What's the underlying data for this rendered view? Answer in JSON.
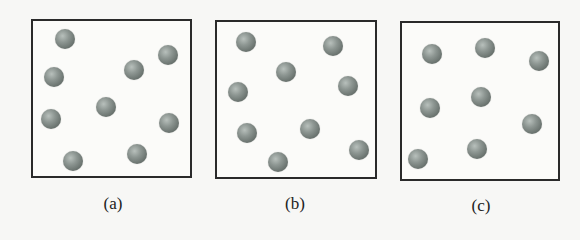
{
  "panels": [
    {
      "id": "a",
      "label": "(a)",
      "box": {
        "x": 31,
        "y": 19,
        "w": 161,
        "h": 159
      },
      "label_pos": {
        "x": 113,
        "y": 194
      },
      "particles": [
        [
          65,
          39
        ],
        [
          168,
          55
        ],
        [
          134,
          70
        ],
        [
          54,
          77
        ],
        [
          106,
          107
        ],
        [
          51,
          119
        ],
        [
          169,
          123
        ],
        [
          73,
          161
        ],
        [
          137,
          154
        ]
      ]
    },
    {
      "id": "b",
      "label": "(b)",
      "box": {
        "x": 215,
        "y": 20,
        "w": 162,
        "h": 159
      },
      "label_pos": {
        "x": 295,
        "y": 194
      },
      "particles": [
        [
          246,
          42
        ],
        [
          333,
          46
        ],
        [
          286,
          72
        ],
        [
          238,
          92
        ],
        [
          348,
          86
        ],
        [
          247,
          133
        ],
        [
          310,
          129
        ],
        [
          359,
          150
        ],
        [
          278,
          162
        ]
      ]
    },
    {
      "id": "c",
      "label": "(c)",
      "box": {
        "x": 400,
        "y": 21,
        "w": 160,
        "h": 160
      },
      "label_pos": {
        "x": 481,
        "y": 196
      },
      "particles": [
        [
          432,
          54
        ],
        [
          485,
          48
        ],
        [
          539,
          61
        ],
        [
          481,
          97
        ],
        [
          430,
          108
        ],
        [
          532,
          124
        ],
        [
          477,
          149
        ],
        [
          418,
          159
        ]
      ]
    }
  ],
  "colors": {
    "border": "#2a2a2a",
    "particle": "#7d8682",
    "background": "#f7f7f5"
  }
}
